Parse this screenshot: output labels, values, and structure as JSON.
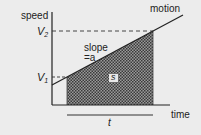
{
  "diagram": {
    "y_axis_label": "speed",
    "x_axis_label": "time",
    "line_label": "motion",
    "v2_label": "V",
    "v2_sub": "2",
    "v1_label": "V",
    "v1_sub": "1",
    "slope_line1": "slope",
    "slope_line2": "=a",
    "area_label": "s",
    "interval_label": "t",
    "colors": {
      "background": "#ececec",
      "lines": "#222222",
      "shade": "#555555"
    }
  }
}
